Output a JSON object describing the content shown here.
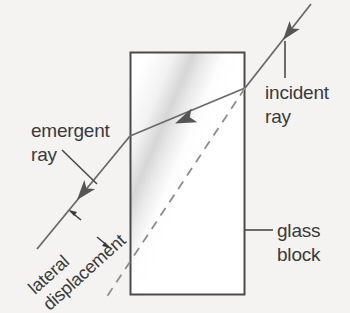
{
  "diagram": {
    "background_color": "#f4f3f2",
    "ink_color": "#5a5a5a",
    "text_color": "#3a3a3a",
    "block_fill": "#ffffff",
    "labels": {
      "incident_ray_line1": "incident",
      "incident_ray_line2": "ray",
      "emergent_ray_line1": "emergent",
      "emergent_ray_line2": "ray",
      "glass_block_line1": "glass",
      "glass_block_line2": "block",
      "lateral_displacement_line1": "lateral",
      "lateral_displacement_line2": "displacement"
    },
    "icons": {
      "incident_arrow": "arrowhead-down-left-icon",
      "refracted_arrow": "arrowhead-left-icon",
      "emergent_arrow": "arrowhead-down-left-icon",
      "displacement_arrow_upper": "small-arrow-up-left-icon",
      "displacement_arrow_lower": "small-arrow-down-right-icon"
    },
    "geometry": {
      "block_x": 130,
      "block_y": 52,
      "block_width": 115,
      "block_height": 243,
      "entry_point_x": 245,
      "entry_point_y": 88,
      "exit_point_x": 130,
      "exit_point_y": 136,
      "incident_start_x": 311,
      "incident_start_y": 4,
      "emergent_end_x": 37,
      "emergent_end_y": 249,
      "dashed_end_x": 104,
      "dashed_end_y": 301
    }
  }
}
